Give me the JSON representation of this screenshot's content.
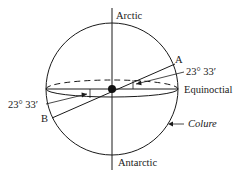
{
  "diagram": {
    "labels": {
      "north_pole": "Arctic",
      "south_pole": "Antarctic",
      "point_a": "A",
      "point_b": "B",
      "angle_right": "23° 33′",
      "angle_left": "23° 33′",
      "equator": "Equinoctial",
      "great_circle": "Colure"
    },
    "colors": {
      "stroke": "#1a1a1a",
      "background": "#ffffff"
    }
  }
}
